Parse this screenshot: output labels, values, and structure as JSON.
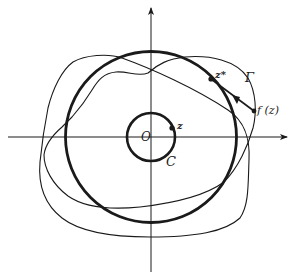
{
  "figure": {
    "labels": {
      "origin": "O",
      "point_z": "z",
      "point_z_star": "z*",
      "point_fz": "f (z)",
      "circle_c": "C",
      "curve_gamma": "Γ"
    },
    "elements": [
      {
        "name": "x-axis",
        "type": "arrow-line",
        "direction": "right"
      },
      {
        "name": "y-axis",
        "type": "arrow-line",
        "direction": "up"
      },
      {
        "name": "small-circle-C",
        "type": "circle",
        "center": "O",
        "stroke": "thick"
      },
      {
        "name": "large-circle",
        "type": "circle",
        "center": "O",
        "stroke": "thick"
      },
      {
        "name": "curve-gamma",
        "type": "closed-curve",
        "stroke": "thin"
      },
      {
        "name": "wavy-curve",
        "type": "closed-curve",
        "stroke": "thin"
      },
      {
        "name": "arrow-fz-to-zstar",
        "type": "arrow",
        "from": "f (z)",
        "to": "z*"
      }
    ],
    "colors": {
      "ink": "#1a1a1a",
      "background": "#ffffff"
    }
  }
}
